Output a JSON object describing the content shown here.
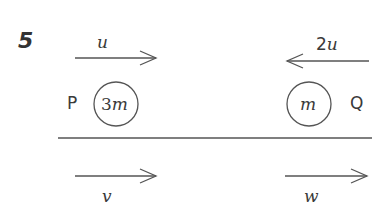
{
  "question": {
    "number": "5"
  },
  "particles": [
    {
      "name": "P",
      "mass_coef": "3",
      "mass_sym": "m",
      "initial_velocity": "u",
      "initial_direction": "right",
      "final_velocity": "v",
      "final_direction": "right"
    },
    {
      "name": "Q",
      "mass_coef": "",
      "mass_sym": "m",
      "initial_velocity": "2u",
      "initial_direction": "left",
      "final_velocity": "w",
      "final_direction": "right"
    }
  ],
  "labels": {
    "u_coef": "",
    "u_sym": "u",
    "two_u_coef": "2",
    "two_u_sym": "u",
    "v": "v",
    "w": "w"
  },
  "colors": {
    "ink": "#555555",
    "background": "#ffffff"
  }
}
